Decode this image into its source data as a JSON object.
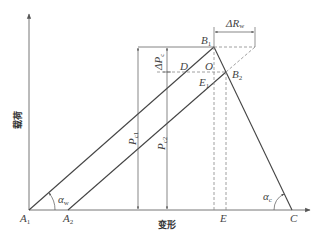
{
  "diagram": {
    "axes": {
      "y_label": "载荷",
      "x_label": "变形"
    },
    "points": {
      "A1": {
        "main": "A",
        "sub": "1"
      },
      "A2": {
        "main": "A",
        "sub": "2"
      },
      "B1": {
        "main": "B",
        "sub": "1"
      },
      "B2": {
        "main": "B",
        "sub": "2"
      },
      "C": {
        "main": "C"
      },
      "E": {
        "main": "E"
      },
      "E1": {
        "main": "E",
        "sub": "1"
      },
      "D": {
        "main": "D"
      },
      "O": {
        "main": "O"
      }
    },
    "dimensions": {
      "delta_rw": {
        "main": "ΔR",
        "sub": "w"
      },
      "delta_pc": {
        "main": "ΔP",
        "sub": "c"
      },
      "pc1": {
        "main": "P",
        "sub": "c1"
      },
      "pc2": {
        "main": "P",
        "sub": "c2"
      }
    },
    "angles": {
      "alpha_w": {
        "main": "α",
        "sub": "w"
      },
      "alpha_c": {
        "main": "α",
        "sub": "c"
      }
    },
    "colors": {
      "line": "#444444",
      "dashed": "#888888",
      "axis": "#666666"
    }
  }
}
